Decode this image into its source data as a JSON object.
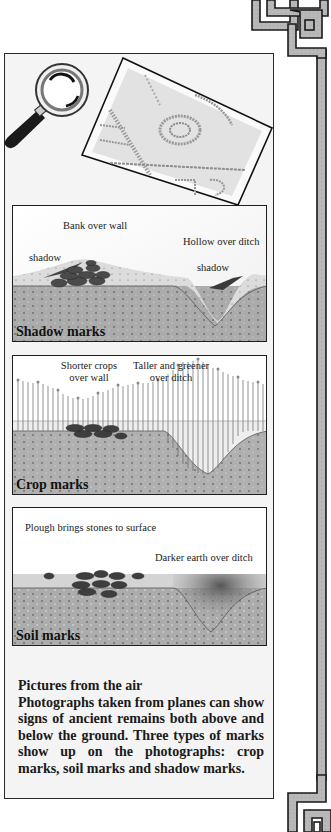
{
  "page": {
    "hero": {
      "magnifier_icon": "magnifying-glass",
      "photo": "aerial-photograph-print"
    },
    "diagrams": [
      {
        "id": "shadow",
        "caption": "Shadow marks",
        "labels": {
          "bank": "Bank over wall",
          "hollow": "Hollow over ditch",
          "shadow_left": "shadow",
          "shadow_right": "shadow"
        }
      },
      {
        "id": "crop",
        "caption": "Crop marks",
        "labels": {
          "shorter_line1": "Shorter crops",
          "shorter_line2": "over wall",
          "taller_line1": "Taller and greener",
          "taller_line2": "over ditch"
        }
      },
      {
        "id": "soil",
        "caption": "Soil marks",
        "labels": {
          "plough": "Plough brings stones to surface",
          "darker": "Darker earth over ditch"
        }
      }
    ],
    "text": {
      "title": "Pictures from the air",
      "body": "Photographs taken from planes can show signs of ancient remains both above and below the ground. Three types of marks show up on the photographs: crop marks, soil marks and shadow marks."
    },
    "colors": {
      "soil_dark": "#a8a8a8",
      "soil_light": "#d8d8d8",
      "stone": "#4a4a4a",
      "border_band": "#b5b5b5",
      "ink": "#1e1e1e"
    }
  }
}
